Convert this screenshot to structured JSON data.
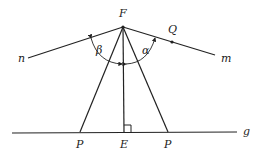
{
  "diagram": {
    "points": {
      "F": {
        "label": "F",
        "x": 123,
        "y": 27
      },
      "Q": {
        "label": "Q",
        "x": 172,
        "y": 42
      },
      "P_left": {
        "label": "P",
        "x": 80,
        "y": 132
      },
      "E": {
        "label": "E",
        "x": 124,
        "y": 132
      },
      "P_right": {
        "label": "P",
        "x": 168,
        "y": 132
      }
    },
    "lines": {
      "n": {
        "label": "n"
      },
      "m": {
        "label": "m"
      },
      "g": {
        "label": "g"
      }
    },
    "angles": {
      "alpha": {
        "label": "α"
      },
      "beta": {
        "label": "β"
      }
    },
    "right_angle_marker": "E",
    "stroke_color": "#222222"
  }
}
